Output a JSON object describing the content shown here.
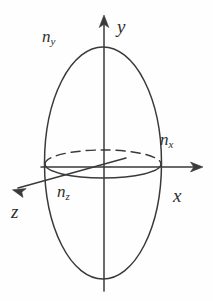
{
  "figure": {
    "background_color": "#fefefe",
    "stroke_color": "#3a3a3a",
    "labels": {
      "y_axis": "y",
      "x_axis": "x",
      "z_axis": "z",
      "n_y": {
        "base": "n",
        "sub": "y"
      },
      "n_x": {
        "base": "n",
        "sub": "x"
      },
      "n_z": {
        "base": "n",
        "sub": "z"
      }
    },
    "geometry": {
      "origin": {
        "x": 103,
        "y": 167
      },
      "vertical_ellipse": {
        "cx": 103,
        "cy": 163,
        "rx": 58,
        "ry": 116
      },
      "equator_ellipse": {
        "cx": 103,
        "cy": 164,
        "rx": 58,
        "ry": 14
      },
      "y_axis_arrow_tip": {
        "x": 104,
        "y": 16
      },
      "y_axis_bottom": {
        "x": 104,
        "y": 291
      },
      "x_axis_arrow_tip": {
        "x": 203,
        "y": 167
      },
      "z_axis_arrow_tip": {
        "x": 13,
        "y": 190
      },
      "equator_back_dashed": true
    }
  }
}
